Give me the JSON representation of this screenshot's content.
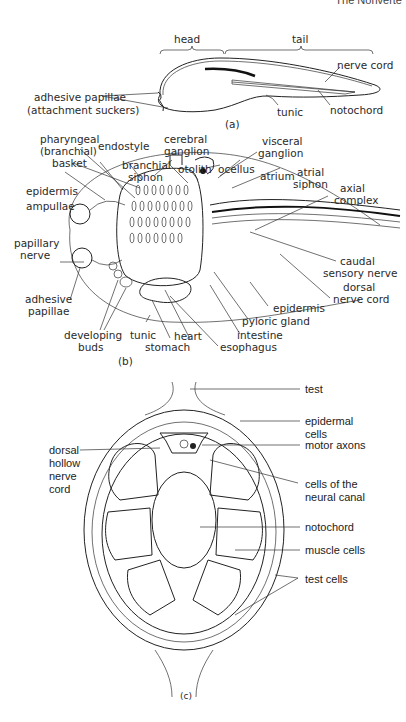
{
  "header": {
    "running_title": "The Nonverte"
  },
  "figure_a": {
    "caption": "(a)",
    "regions": [
      "head",
      "tail"
    ],
    "labels": {
      "adhesive_papillae": "adhesive papillae",
      "attachment_suckers": "(attachment suckers)",
      "nerve_cord": "nerve cord",
      "tunic": "tunic",
      "notochord": "notochord"
    }
  },
  "figure_b": {
    "caption": "(b)",
    "labels": {
      "pharyngeal_1": "pharyngeal",
      "pharyngeal_2": "(branchial)",
      "pharyngeal_3": "basket",
      "endostyle": "endostyle",
      "cerebral_1": "cerebral",
      "cerebral_2": "ganglion",
      "visceral_1": "visceral",
      "visceral_2": "ganglion",
      "branchial_1": "branchial",
      "branchial_2": "siphon",
      "otolith": "otolith",
      "ocellus": "ocellus",
      "atrium": "atrium",
      "atrial_1": "atrial",
      "atrial_2": "siphon",
      "epidermis_top": "epidermis",
      "axial_1": "axial",
      "axial_2": "complex",
      "ampullae": "ampullae",
      "papillary_1": "papillary",
      "papillary_2": "nerve",
      "caudal_1": "caudal",
      "caudal_2": "sensory nerve",
      "dorsal_1": "dorsal",
      "dorsal_2": "nerve cord",
      "adhesive_1": "adhesive",
      "adhesive_2": "papillae",
      "epidermis_bottom": "epidermis",
      "pyloric_gland": "pyloric gland",
      "intestine": "intestine",
      "developing_1": "developing",
      "developing_2": "buds",
      "tunic": "tunic",
      "heart": "heart",
      "stomach": "stomach",
      "esophagus": "esophagus"
    }
  },
  "figure_c": {
    "caption": "(c)",
    "labels": {
      "test": "test",
      "epidermal_1": "epidermal",
      "epidermal_2": "cells",
      "motor_axons": "motor axons",
      "dorsal_1": "dorsal",
      "dorsal_2": "hollow",
      "dorsal_3": "nerve",
      "dorsal_4": "cord",
      "neural_1": "cells of the",
      "neural_2": "neural canal",
      "notochord": "notochord",
      "muscle_cells": "muscle cells",
      "test_cells": "test cells"
    }
  }
}
